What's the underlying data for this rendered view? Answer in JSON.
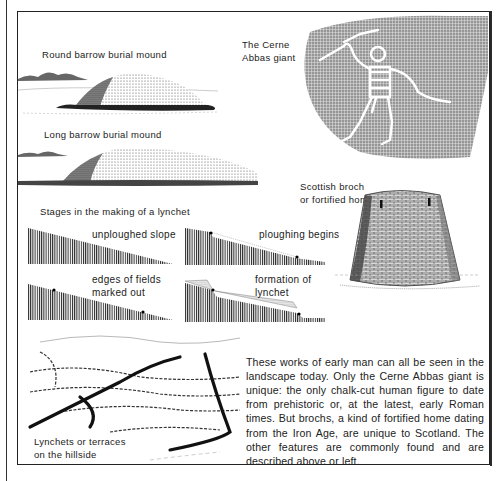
{
  "page": {
    "captions": {
      "round_barrow": "Round barrow burial mound",
      "long_barrow": "Long barrow burial mound",
      "cerne_abbas_line1": "The Cerne",
      "cerne_abbas_line2": "Abbas giant",
      "broch_line1": "Scottish broch",
      "broch_line2": "or fortified home",
      "lynchet_stages_title": "Stages in the making of a lynchet",
      "stage_unploughed": "unploughed slope",
      "stage_ploughing": "ploughing begins",
      "stage_edges_line1": "edges of fields",
      "stage_edges_line2": "marked out",
      "stage_formation_line1": "formation of",
      "stage_formation_line2": "lynchet",
      "lynchets_line1": "Lynchets or terraces",
      "lynchets_line2": "on the hillside"
    },
    "body_text": "These works of early man can all be seen in the landscape today. Only the Cerne Abbas giant is unique: the only chalk-cut human figure to date from prehistoric or, at the latest, early Roman times. But brochs, a kind of fortified home dating from the Iron Age, are unique to Scotland. The other features are commonly found and are described above or left.",
    "colors": {
      "ink": "#1a1a1a",
      "paper": "#ffffff"
    }
  }
}
